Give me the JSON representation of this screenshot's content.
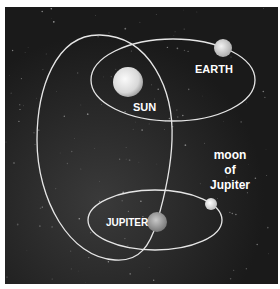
{
  "diagram": {
    "background": "space",
    "colors": {
      "space": "#1c1c1c",
      "orbit": "#e6e6e6",
      "label": "#ffffff",
      "border": "#ffffff"
    },
    "bodies": [
      {
        "id": "sun",
        "label": "SUN"
      },
      {
        "id": "earth",
        "label": "EARTH"
      },
      {
        "id": "jupiter",
        "label": "JUPITER"
      },
      {
        "id": "moon",
        "label_lines": [
          "moon",
          "of",
          "Jupiter"
        ]
      }
    ],
    "orbits": [
      {
        "id": "earth-orbit",
        "around": "sun"
      },
      {
        "id": "jupiter-orbit",
        "around": "sun"
      },
      {
        "id": "moon-orbit",
        "around": "jupiter"
      }
    ]
  }
}
